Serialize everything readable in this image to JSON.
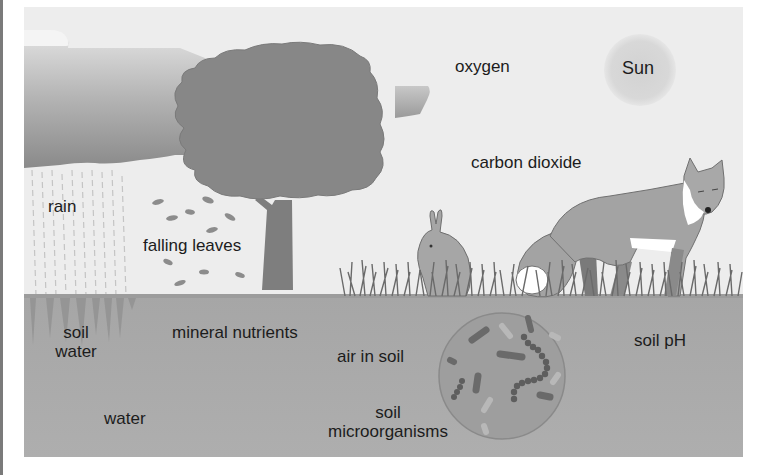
{
  "figure": {
    "type": "ecosystem-factors-diagram",
    "colors": {
      "sky": "#ececec",
      "cloud_dark": "#8e8e8e",
      "cloud_light": "#d4d4d4",
      "tree": "#8a8a8a",
      "soil": "#ababab",
      "sun": "#d6d6d6",
      "grass": "#7b7b7b",
      "fox": "#a2a2a2",
      "rabbit": "#a8a8a8",
      "microbe_circle": "#9e9e9e",
      "text": "#1c1c1c"
    }
  },
  "labels": {
    "sun": "Sun",
    "oxygen": "oxygen",
    "carbon_dioxide": "carbon dioxide",
    "rain": "rain",
    "falling_leaves": "falling leaves",
    "soil_water_line1": "soil",
    "soil_water_line2": "water",
    "mineral_nutrients": "mineral nutrients",
    "air_in_soil": "air in soil",
    "soil_microorganisms_line1": "soil",
    "soil_microorganisms_line2": "microorganisms",
    "soil_ph": "soil pH",
    "water": "water"
  }
}
